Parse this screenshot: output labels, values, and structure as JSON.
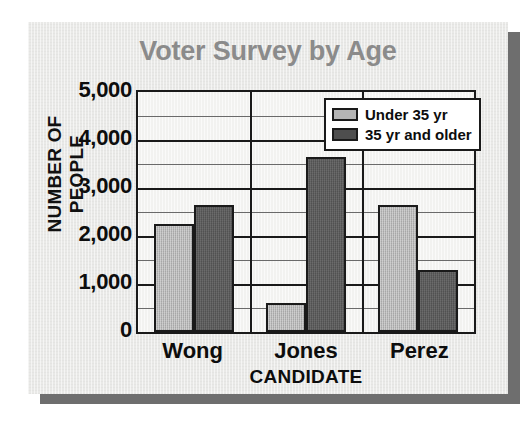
{
  "chart_data": {
    "type": "bar",
    "title": "Voter Survey by Age",
    "xlabel": "CANDIDATE",
    "ylabel": "NUMBER OF PEOPLE",
    "categories": [
      "Wong",
      "Jones",
      "Perez"
    ],
    "series": [
      {
        "name": "Under 35 yr",
        "color": "#b4b4b4",
        "values": [
          2250,
          600,
          2650
        ]
      },
      {
        "name": "35 yr and older",
        "color": "#4e4e4e",
        "values": [
          2650,
          3650,
          1300
        ]
      }
    ],
    "ylim": [
      0,
      5000
    ],
    "ytick_labels": [
      "5,000",
      "4,000",
      "3,000",
      "2,000",
      "1,000",
      "0"
    ],
    "ytick_values": [
      5000,
      4000,
      3000,
      2000,
      1000,
      0
    ],
    "minor_tick_step": 500,
    "grid": true,
    "legend_position": "top-right"
  },
  "legend": {
    "entries": [
      {
        "label": "Under 35 yr",
        "swatch": "light"
      },
      {
        "label": "35 yr and older",
        "swatch": "dark"
      }
    ]
  }
}
